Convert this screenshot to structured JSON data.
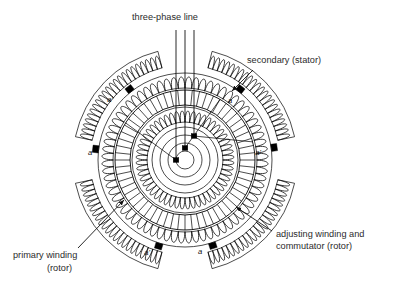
{
  "figure": {
    "background_color": "#ffffff",
    "ink_color": "#000000",
    "width": 405,
    "height": 293
  },
  "callouts": [
    {
      "id": "three-phase-line",
      "text": "three-phase line",
      "x": 165,
      "y": 20,
      "anchor": "middle",
      "has_arrow": false
    },
    {
      "id": "secondary-stator",
      "text": "secondary (stator)",
      "x": 247,
      "y": 63,
      "anchor": "start",
      "has_arrow": true,
      "arrow_from": [
        253,
        70
      ],
      "arrow_to": [
        232,
        91
      ]
    },
    {
      "id": "adjusting-winding",
      "line1": "adjusting winding and",
      "line2": "commutator (rotor)",
      "x": 276,
      "y": 237,
      "anchor": "start",
      "has_arrow": true,
      "arrow_from": [
        272,
        231
      ],
      "arrow_to": [
        236,
        207
      ]
    },
    {
      "id": "primary-winding",
      "line1": "primary winding",
      "line2": "(rotor)",
      "x": 13,
      "y": 258,
      "anchor": "start",
      "has_arrow": true,
      "arrow_from": [
        78,
        248
      ],
      "arrow_to": [
        124,
        200
      ]
    }
  ],
  "terminal_labels": [
    {
      "id": "stator-terminal-upper-left",
      "text": "a'",
      "x": 110,
      "y": 102
    },
    {
      "id": "stator-terminal-left",
      "text": "a",
      "x": 90,
      "y": 155
    },
    {
      "id": "stator-terminal-upper-right",
      "text": "a",
      "x": 230,
      "y": 103
    },
    {
      "id": "stator-terminal-right",
      "text": "a'",
      "x": 258,
      "y": 155
    },
    {
      "id": "stator-terminal-bottom-left",
      "text": "a'",
      "x": 147,
      "y": 255
    },
    {
      "id": "stator-terminal-bottom-right",
      "text": "a",
      "x": 200,
      "y": 254
    }
  ],
  "machine": {
    "center": {
      "x": 185,
      "y": 160
    },
    "shaft_circles_radii": [
      9,
      17,
      25,
      33
    ],
    "rings": [
      {
        "id": "primary-winding-ring",
        "inner_radius": 38,
        "outer_radius": 53,
        "coil_count": 52,
        "name": "primary winding (rotor)"
      },
      {
        "id": "commutator-ring",
        "inner_radius": 55,
        "outer_radius": 70,
        "bar_count": 60,
        "name": "commutator bars"
      },
      {
        "id": "adjusting-winding-ring",
        "inner_radius": 72,
        "outer_radius": 87,
        "coil_count": 68,
        "name": "adjusting winding (rotor)"
      }
    ],
    "stator_segments": [
      {
        "id": "stator-seg-upper-left",
        "start_angle": 192,
        "end_angle": 256,
        "inner_radius": 95,
        "outer_radius": 112,
        "coil_count": 22
      },
      {
        "id": "stator-seg-upper-right",
        "start_angle": 284,
        "end_angle": 348,
        "inner_radius": 95,
        "outer_radius": 112,
        "coil_count": 22
      },
      {
        "id": "stator-seg-lower-right",
        "start_angle": 12,
        "end_angle": 76,
        "inner_radius": 95,
        "outer_radius": 112,
        "coil_count": 22
      },
      {
        "id": "stator-seg-lower-left",
        "start_angle": 104,
        "end_angle": 168,
        "inner_radius": 95,
        "outer_radius": 112,
        "coil_count": 22
      }
    ],
    "phase_lines": [
      {
        "id": "phase-line-1",
        "x": 176,
        "y_top": 30,
        "y_end": 160
      },
      {
        "id": "phase-line-2",
        "x": 185,
        "y_top": 30,
        "y_end": 148
      },
      {
        "id": "phase-line-3",
        "x": 194,
        "y_top": 30,
        "y_end": 136
      }
    ],
    "rotor_terminals": [
      {
        "id": "rotor-terminal-1",
        "x": 176,
        "y": 160
      },
      {
        "id": "rotor-terminal-2",
        "x": 185,
        "y": 148
      },
      {
        "id": "rotor-terminal-3",
        "x": 194,
        "y": 136
      }
    ],
    "stator_terminals": [
      {
        "id": "terminal-upper-left",
        "angle": 232,
        "radius": 90
      },
      {
        "id": "terminal-left",
        "angle": 187,
        "radius": 90
      },
      {
        "id": "terminal-upper-right",
        "angle": 308,
        "radius": 90
      },
      {
        "id": "terminal-right",
        "angle": 352,
        "radius": 90
      },
      {
        "id": "terminal-bottom-left",
        "angle": 107,
        "radius": 90
      },
      {
        "id": "terminal-bottom-right",
        "angle": 72,
        "radius": 90
      }
    ]
  }
}
